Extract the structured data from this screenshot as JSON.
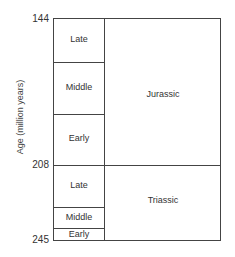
{
  "diagram": {
    "y_axis_label": "Age (million years)",
    "ticks": [
      {
        "value": "144",
        "y": 19
      },
      {
        "value": "208",
        "y": 165
      },
      {
        "value": "245",
        "y": 240
      }
    ],
    "periods": [
      {
        "name": "Jurassic",
        "start_ma": 208,
        "end_ma": 144,
        "epochs": [
          {
            "name": "Late"
          },
          {
            "name": "Middle"
          },
          {
            "name": "Early"
          }
        ]
      },
      {
        "name": "Triassic",
        "start_ma": 245,
        "end_ma": 208,
        "epochs": [
          {
            "name": "Late"
          },
          {
            "name": "Middle"
          },
          {
            "name": "Early"
          }
        ]
      }
    ]
  }
}
